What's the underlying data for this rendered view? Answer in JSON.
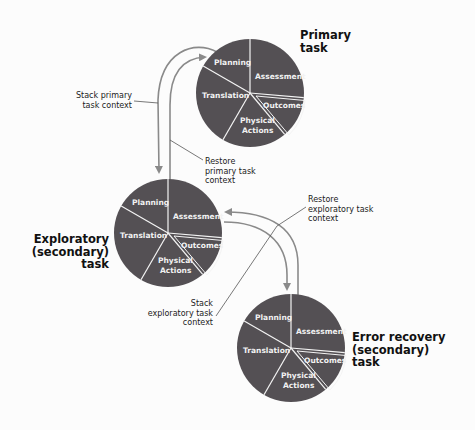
{
  "diagram": {
    "colors": {
      "pie_fill": "#545054",
      "divider": "#f4f4f4",
      "arrow": "#8a8a8a",
      "leader": "#555555",
      "text": "#111111"
    },
    "slices": [
      "Planning",
      "Assessment",
      "Outcomes",
      "Physical",
      "Actions",
      "Translation"
    ],
    "tasks": {
      "primary": {
        "title_line1": "Primary",
        "title_line2": "task"
      },
      "exploratory": {
        "title_line1": "Exploratory",
        "title_line2": "(secondary)",
        "title_line3": "task"
      },
      "error_recovery": {
        "title_line1": "Error recovery",
        "title_line2": "(secondary)",
        "title_line3": "task"
      }
    },
    "annotations": {
      "stack_primary": {
        "line1": "Stack primary",
        "line2": "task context"
      },
      "restore_primary": {
        "line1": "Restore",
        "line2": "primary task",
        "line3": "context"
      },
      "restore_exploratory": {
        "line1": "Restore",
        "line2": "exploratory task",
        "line3": "context"
      },
      "stack_exploratory": {
        "line1": "Stack",
        "line2": "exploratory task",
        "line3": "context"
      }
    }
  }
}
